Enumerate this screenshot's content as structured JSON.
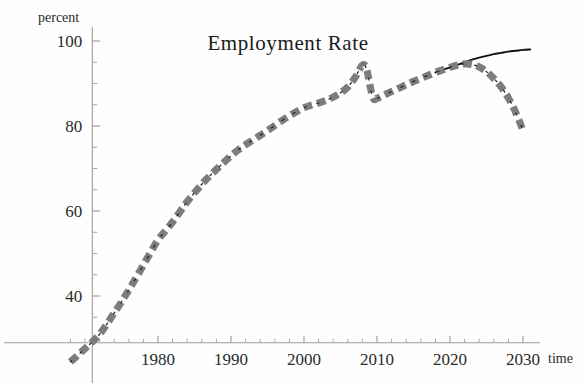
{
  "figure": {
    "title": "Employment Rate",
    "background_color": "#fefefe"
  },
  "chart_data": {
    "type": "line",
    "title": "Employment Rate",
    "xlabel": "time",
    "ylabel": "percent",
    "xlim": [
      1967,
      2032
    ],
    "ylim": [
      22,
      103
    ],
    "grid": false,
    "legend_position": "none",
    "x_ticks_major": [
      1980,
      1990,
      2000,
      2010,
      2020,
      2030
    ],
    "x_tick_labels": [
      "1980",
      "1990",
      "2000",
      "2010",
      "2020",
      "2030"
    ],
    "x_ticks_minor_step": 2,
    "y_ticks_major": [
      40,
      60,
      80,
      100
    ],
    "y_tick_labels": [
      "40",
      "60",
      "80",
      "100"
    ],
    "y_ticks_minor_step": 5,
    "axis_origin": {
      "x_value": 1971,
      "y_value": 29
    },
    "colors": {
      "historical_band": "#7d7d7d",
      "historical_core": "#1c1c1c",
      "projection_solid": "#111111",
      "axis": "#9a9a9a",
      "text": "#2b2b2b"
    },
    "series": [
      {
        "name": "Employment rate (thick dashed)",
        "style": "dashed-thick-gray",
        "x": [
          1968,
          1969,
          1970,
          1971,
          1972,
          1973,
          1974,
          1975,
          1976,
          1977,
          1978,
          1979,
          1980,
          1981,
          1982,
          1983,
          1984,
          1985,
          1986,
          1987,
          1988,
          1989,
          1990,
          1991,
          1992,
          1993,
          1994,
          1995,
          1996,
          1997,
          1998,
          1999,
          2000,
          2001,
          2002,
          2003,
          2004,
          2005,
          2006,
          2007,
          2008,
          2008.6,
          2009.4,
          2010,
          2011,
          2012,
          2013,
          2014,
          2015,
          2016,
          2017,
          2018,
          2019,
          2020,
          2021,
          2022,
          2023,
          2024,
          2025,
          2026,
          2027,
          2028,
          2029,
          2030
        ],
        "y": [
          24.5,
          26.0,
          27.6,
          29.2,
          31.0,
          33.4,
          36.0,
          38.6,
          41.4,
          44.3,
          47.3,
          50.3,
          53.2,
          55.3,
          57.4,
          59.8,
          62.2,
          64.3,
          66.3,
          68.1,
          69.8,
          71.4,
          73.0,
          74.4,
          75.6,
          76.7,
          77.8,
          78.9,
          80.1,
          81.3,
          82.4,
          83.4,
          84.3,
          84.9,
          85.4,
          86.0,
          86.8,
          87.8,
          89.2,
          91.4,
          94.3,
          93.2,
          86.8,
          86.5,
          87.3,
          88.1,
          88.9,
          89.7,
          90.5,
          91.2,
          91.9,
          92.6,
          93.2,
          93.8,
          94.3,
          94.6,
          94.5,
          93.9,
          92.8,
          91.2,
          89.2,
          86.6,
          83.2,
          79.0
        ],
        "description": "Rises from ~25% in 1968 to a peak near 94% in 2008, drops sharply to ~86.5% by 2009-2010, recovers steadily to ~94.6% around 2022, then declines to ~79% by 2030"
      },
      {
        "name": "Projection (thin solid black)",
        "style": "solid-thin-black",
        "x": [
          2018,
          2019,
          2020,
          2021,
          2022,
          2023,
          2024,
          2025,
          2026,
          2027,
          2028,
          2029,
          2030,
          2031
        ],
        "y": [
          92.6,
          93.2,
          93.8,
          94.4,
          95.0,
          95.6,
          96.1,
          96.5,
          96.9,
          97.2,
          97.5,
          97.7,
          97.9,
          98.0
        ],
        "description": "Thin black trend line continuing upward to about 98% at 2030"
      }
    ],
    "annotations": []
  }
}
